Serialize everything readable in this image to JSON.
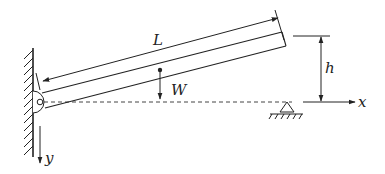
{
  "diagram": {
    "labels": {
      "length": "L",
      "weight": "W",
      "height": "h",
      "x_axis": "x",
      "y_axis": "y"
    },
    "colors": {
      "stroke": "#222222",
      "background": "#ffffff"
    },
    "elements": [
      "fixed-wall-with-hatching",
      "pin-joint",
      "inclined-beam",
      "length-dimension-arrow",
      "weight-arrow",
      "dashed-reference-line",
      "roller-support",
      "height-dimension",
      "x-axis-arrow",
      "y-axis-arrow"
    ]
  }
}
